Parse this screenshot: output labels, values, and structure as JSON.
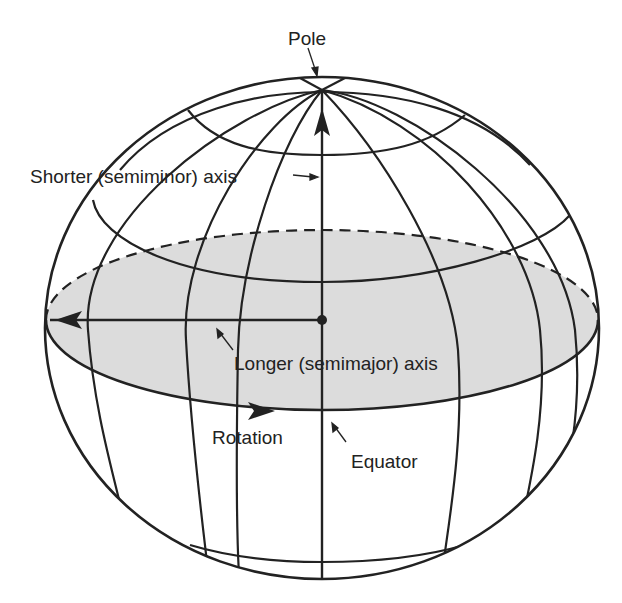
{
  "diagram": {
    "type": "oblate spheroid (Earth ellipsoid) schematic",
    "colors": {
      "line": "#222222",
      "equatorial_plane_fill": "#dcdcdc",
      "background": "#ffffff",
      "label": "#222222"
    },
    "labels": {
      "pole": "Pole",
      "semiminor_axis": "Shorter (semiminor) axis",
      "semimajor_axis": "Longer (semimajor) axis",
      "rotation": "Rotation",
      "equator": "Equator"
    },
    "elements": [
      {
        "id": "sphere-outline",
        "description": "Outer ellipsoid outline"
      },
      {
        "id": "equatorial-plane",
        "description": "Shaded equatorial ellipse, rear half dashed"
      },
      {
        "id": "semiminor-axis",
        "description": "Vertical axis from center to pole with upward arrowhead"
      },
      {
        "id": "semimajor-axis",
        "description": "Horizontal axis from center to left edge with arrowhead"
      },
      {
        "id": "rotation-arrow",
        "description": "Arrowhead on front equator pointing right"
      },
      {
        "id": "meridians",
        "description": "Longitude lines converging at the pole"
      },
      {
        "id": "parallels",
        "description": "Latitude circles above and below the equator"
      }
    ]
  }
}
